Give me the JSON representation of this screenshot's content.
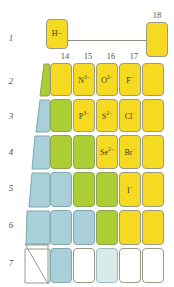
{
  "figure": {
    "kind": "periodic-table-fragment"
  },
  "colors": {
    "yellow": "#f6da22",
    "green": "#aace34",
    "blue": "#a9cfd9",
    "pale_blue": "#d8ebe9",
    "white": "#ffffff",
    "border": "#9a9a86",
    "text": "#3d3a24",
    "label": "#55554a"
  },
  "row_labels": [
    "1",
    "2",
    "3",
    "4",
    "5",
    "6",
    "7"
  ],
  "group_labels": [
    "14",
    "15",
    "16",
    "17",
    "18"
  ],
  "hydrogen": {
    "symbol": "H",
    "charge": "−",
    "label": "H−"
  },
  "cells": {
    "r2": [
      {
        "label": "",
        "color": "green"
      },
      {
        "label": "",
        "color": "yellow"
      },
      {
        "label": "N",
        "sup": "3−",
        "color": "yellow"
      },
      {
        "label": "O",
        "sup": "2−",
        "color": "yellow"
      },
      {
        "label": "F",
        "sup": "−",
        "color": "yellow"
      },
      {
        "label": "",
        "color": "yellow"
      }
    ],
    "r3": [
      {
        "label": "",
        "color": "blue"
      },
      {
        "label": "",
        "color": "green"
      },
      {
        "label": "P",
        "sup": "3−",
        "color": "yellow"
      },
      {
        "label": "S",
        "sup": "2−",
        "color": "yellow"
      },
      {
        "label": "Cl",
        "sup": "−",
        "color": "yellow"
      },
      {
        "label": "",
        "color": "yellow"
      }
    ],
    "r4": [
      {
        "label": "",
        "color": "blue"
      },
      {
        "label": "",
        "color": "green"
      },
      {
        "label": "",
        "color": "green"
      },
      {
        "label": "Se",
        "sup": "2−",
        "color": "yellow"
      },
      {
        "label": "Br",
        "sup": "−",
        "color": "yellow"
      },
      {
        "label": "",
        "color": "yellow"
      }
    ],
    "r5": [
      {
        "label": "",
        "color": "blue"
      },
      {
        "label": "",
        "color": "blue"
      },
      {
        "label": "",
        "color": "green"
      },
      {
        "label": "",
        "color": "green"
      },
      {
        "label": "I",
        "sup": "−",
        "color": "yellow"
      },
      {
        "label": "",
        "color": "yellow"
      }
    ],
    "r6": [
      {
        "label": "",
        "color": "blue"
      },
      {
        "label": "",
        "color": "blue"
      },
      {
        "label": "",
        "color": "blue"
      },
      {
        "label": "",
        "color": "green"
      },
      {
        "label": "",
        "color": "yellow"
      },
      {
        "label": "",
        "color": "yellow"
      }
    ],
    "r7": [
      {
        "label": "",
        "color": "white"
      },
      {
        "label": "",
        "color": "blue"
      },
      {
        "label": "",
        "color": "white"
      },
      {
        "label": "",
        "color": "pale_blue"
      },
      {
        "label": "",
        "color": "white"
      },
      {
        "label": "",
        "color": "white"
      }
    ]
  }
}
